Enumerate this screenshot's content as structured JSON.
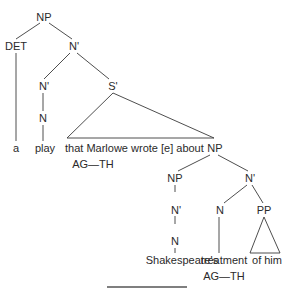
{
  "diagram": {
    "type": "syntax-tree",
    "nodes": {
      "root_np": "NP",
      "det": "DET",
      "n_bar_1": "N'",
      "n_bar_2": "N'",
      "s_bar": "S'",
      "n_1": "N",
      "np_obj": "NP",
      "np_poss": "NP",
      "n_bar_3": "N'",
      "n_bar_poss": "N'",
      "n_head": "N",
      "pp": "PP",
      "n_poss": "N"
    },
    "words": {
      "a": "a",
      "play": "play",
      "clause": "that Marlowe wrote [e] about",
      "shakespeares": "Shakespeare's",
      "treatment": "treatment",
      "of_him": "of him"
    },
    "annotations": {
      "roles_wrote": "AG—TH",
      "roles_treatment": "AG—TH"
    },
    "colors": {
      "line": "#3a3a3a",
      "text": "#2a2a2a",
      "rule": "#555555"
    }
  }
}
